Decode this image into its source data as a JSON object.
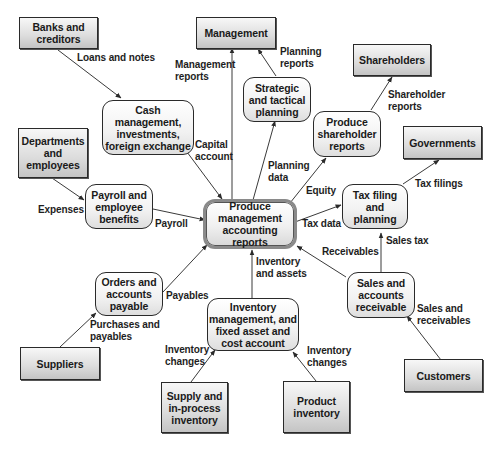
{
  "diagram": {
    "central_process": "Produce\nmanagement\naccounting reports",
    "entities": {
      "banks": "Banks and\ncreditors",
      "management": "Management",
      "shareholders": "Shareholders",
      "departments": "Departments\nand\nemployees",
      "governments": "Governments",
      "suppliers": "Suppliers",
      "customers": "Customers",
      "supply_inventory": "Supply and\nin-process\ninventory",
      "product_inventory": "Product\ninventory"
    },
    "processes": {
      "cash": "Cash\nmanagement,\ninvestments,\nforeign exchange",
      "strategic": "Strategic\nand tactical\nplanning",
      "shareholder_reports": "Produce\nshareholder\nreports",
      "payroll": "Payroll and\nemployee\nbenefits",
      "tax": "Tax filing\nand\nplanning",
      "orders": "Orders and\naccounts\npayable",
      "inventory": "Inventory\nmanagement, and\nfixed asset and\ncost account",
      "sales": "Sales and\naccounts\nreceivable"
    },
    "flows": {
      "loans_notes": "Loans and notes",
      "management_reports": "Management\nreports",
      "planning_reports": "Planning\nreports",
      "shareholder_reports": "Shareholder\nreports",
      "capital_account": "Capital\naccount",
      "planning_data": "Planning\ndata",
      "equity": "Equity",
      "tax_filings": "Tax filings",
      "expenses": "Expenses",
      "payroll": "Payroll",
      "tax_data": "Tax data",
      "receivables": "Receivables",
      "sales_tax": "Sales tax",
      "inventory_assets": "Inventory\nand assets",
      "payables": "Payables",
      "purchases_payables": "Purchases and\npayables",
      "inventory_changes_left": "Inventory\nchanges",
      "inventory_changes_right": "Inventory\nchanges",
      "sales_receivables": "Sales and\nreceivables"
    },
    "colors": {
      "line": "#3a3a3a",
      "entity_fill": "#d8d8d8",
      "process_fill": "#f2f2f2",
      "center_border": "#8a8a8a"
    }
  }
}
